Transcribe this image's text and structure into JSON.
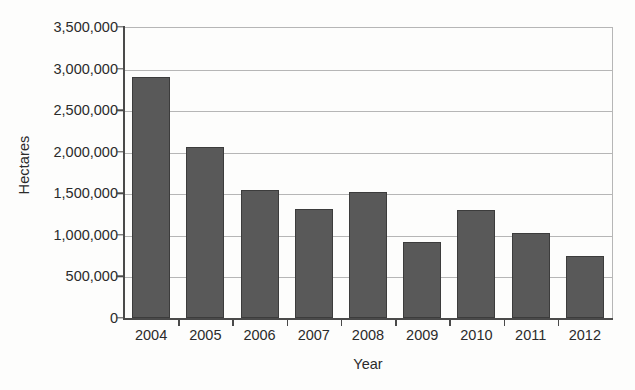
{
  "chart_data": {
    "type": "bar",
    "title": "",
    "subtitle": "",
    "xlabel": "Year",
    "ylabel": "Hectares",
    "categories": [
      "2004",
      "2005",
      "2006",
      "2007",
      "2008",
      "2009",
      "2010",
      "2011",
      "2012"
    ],
    "values": [
      2900000,
      2060000,
      1540000,
      1310000,
      1510000,
      920000,
      1300000,
      1020000,
      740000
    ],
    "series": [
      {
        "name": "Hectares",
        "values": [
          2900000,
          2060000,
          1540000,
          1310000,
          1510000,
          920000,
          1300000,
          1020000,
          740000
        ]
      }
    ],
    "ylim": [
      0,
      3500000
    ],
    "ytick_values": [
      0,
      500000,
      1000000,
      1500000,
      2000000,
      2500000,
      3000000,
      3500000
    ],
    "ytick_labels": [
      "0",
      "500,000",
      "1,000,000",
      "1,500,000",
      "2,000,000",
      "2,500,000",
      "3,000,000",
      "3,500,000"
    ],
    "grid": true,
    "grid_axis": "y",
    "legend": false,
    "legend_position": "none",
    "annotations": [],
    "colors": {
      "bar_fill": "#595959",
      "bar_outline": "#3c3c3c",
      "gridline": "#b6b6b6",
      "axis_line": "#4a4a4a",
      "text": "#2b2b2b",
      "background": "#fdfdfc"
    }
  }
}
